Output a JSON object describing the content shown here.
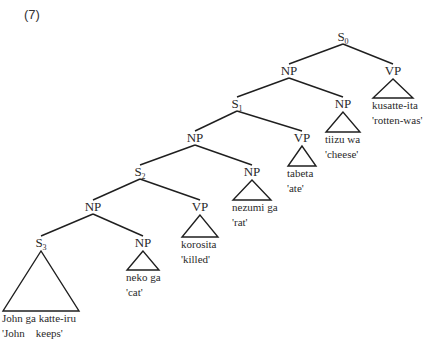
{
  "example_number": "(7)",
  "tree": {
    "nodes": [
      {
        "id": "S0",
        "label": "S",
        "sub": "0"
      },
      {
        "id": "NP_a",
        "label": "NP"
      },
      {
        "id": "VP_a",
        "label": "VP",
        "leaf": [
          "kusatte-ita",
          "'rotten-was'"
        ]
      },
      {
        "id": "S1",
        "label": "S",
        "sub": "1"
      },
      {
        "id": "NP_b",
        "label": "NP",
        "leaf": [
          "tiizu wa",
          "'cheese'"
        ]
      },
      {
        "id": "NP_c",
        "label": "NP"
      },
      {
        "id": "VP_b",
        "label": "VP",
        "leaf": [
          "tabeta",
          "'ate'"
        ]
      },
      {
        "id": "S2",
        "label": "S",
        "sub": "2"
      },
      {
        "id": "NP_d",
        "label": "NP",
        "leaf": [
          "nezumi ga",
          "'rat'"
        ]
      },
      {
        "id": "NP_e",
        "label": "NP"
      },
      {
        "id": "VP_c",
        "label": "VP",
        "leaf": [
          "korosita",
          "'killed'"
        ]
      },
      {
        "id": "S3",
        "label": "S",
        "sub": "3",
        "leaf": [
          "John ga katte-iru",
          "'John    keeps'"
        ]
      },
      {
        "id": "NP_f",
        "label": "NP",
        "leaf": [
          "neko ga",
          "'cat'"
        ]
      }
    ],
    "edges": [
      [
        "S0",
        "NP_a"
      ],
      [
        "S0",
        "VP_a"
      ],
      [
        "NP_a",
        "S1"
      ],
      [
        "NP_a",
        "NP_b"
      ],
      [
        "S1",
        "NP_c"
      ],
      [
        "S1",
        "VP_b"
      ],
      [
        "NP_c",
        "S2"
      ],
      [
        "NP_c",
        "NP_d"
      ],
      [
        "S2",
        "NP_e"
      ],
      [
        "S2",
        "VP_c"
      ],
      [
        "NP_e",
        "S3"
      ],
      [
        "NP_e",
        "NP_f"
      ]
    ]
  }
}
